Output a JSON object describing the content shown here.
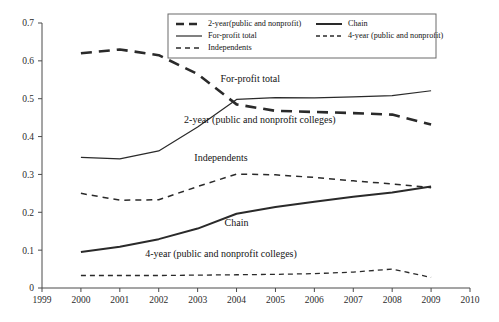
{
  "chart_data": {
    "type": "line",
    "title": "",
    "xlabel": "",
    "ylabel": "",
    "x": [
      2000,
      2001,
      2002,
      2003,
      2004,
      2005,
      2006,
      2007,
      2008,
      2009
    ],
    "xlim": [
      1999,
      2010
    ],
    "ylim": [
      0,
      0.7
    ],
    "grid": false,
    "legend_position": "top-center",
    "xticklabels": [
      "1999",
      "2000",
      "2001",
      "2002",
      "2003",
      "2004",
      "2005",
      "2006",
      "2007",
      "2008",
      "2009",
      "2010"
    ],
    "yticklabels": [
      "0",
      "0.1",
      "0.2",
      "0.3",
      "0.4",
      "0.5",
      "0.6",
      "0.7"
    ],
    "yticks": [
      0,
      0.1,
      0.2,
      0.3,
      0.4,
      0.5,
      0.6,
      0.7
    ],
    "series": [
      {
        "name": "2-year(public and nonprofit)",
        "style": "thick-dashed",
        "values": [
          0.62,
          0.63,
          0.615,
          0.565,
          0.485,
          0.468,
          0.465,
          0.462,
          0.458,
          0.432
        ]
      },
      {
        "name": "For-profit total",
        "style": "solid-thin",
        "values": [
          0.345,
          0.341,
          0.362,
          0.425,
          0.498,
          0.503,
          0.502,
          0.505,
          0.508,
          0.521
        ]
      },
      {
        "name": "Independents",
        "style": "dashed",
        "values": [
          0.25,
          0.232,
          0.233,
          0.268,
          0.301,
          0.299,
          0.292,
          0.283,
          0.275,
          0.265
        ]
      },
      {
        "name": "Chain",
        "style": "solid-thick",
        "values": [
          0.095,
          0.109,
          0.129,
          0.157,
          0.196,
          0.214,
          0.228,
          0.241,
          0.252,
          0.268
        ]
      },
      {
        "name": "4-year (public and nonprofit)",
        "style": "dashed-thin",
        "values": [
          0.033,
          0.033,
          0.033,
          0.034,
          0.035,
          0.036,
          0.038,
          0.042,
          0.05,
          0.028
        ]
      }
    ],
    "annotations": [
      {
        "text": "For-profit total",
        "x": 2004.35,
        "y": 0.545
      },
      {
        "text": "2-year (public and nonprofit colleges)",
        "x": 2004.6,
        "y": 0.437
      },
      {
        "text": "Independents",
        "x": 2003.6,
        "y": 0.335
      },
      {
        "text": "Chain",
        "x": 2004.0,
        "y": 0.163
      },
      {
        "text": "4-year (public and nonprofit colleges)",
        "x": 2003.6,
        "y": 0.082
      }
    ],
    "legend": [
      {
        "label": "2-year(public and nonprofit)",
        "style": "thick-dashed",
        "col": 0,
        "row": 0
      },
      {
        "label": "For-profit total",
        "style": "solid-thin",
        "col": 0,
        "row": 1
      },
      {
        "label": "Independents",
        "style": "dashed",
        "col": 0,
        "row": 2
      },
      {
        "label": "Chain",
        "style": "solid-thick",
        "col": 1,
        "row": 0
      },
      {
        "label": "4-year (public and nonprofit)",
        "style": "dashed-thin",
        "col": 1,
        "row": 1
      }
    ]
  },
  "caption": {
    "text": ""
  }
}
